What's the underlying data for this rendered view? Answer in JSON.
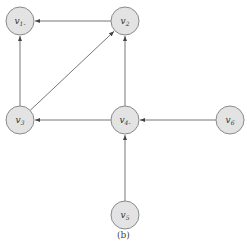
{
  "diagram": {
    "caption": "(b)",
    "nodes": [
      {
        "id": "v1",
        "base": "v",
        "sub": "1",
        "suffix": "-"
      },
      {
        "id": "v2",
        "base": "v",
        "sub": "2",
        "suffix": ""
      },
      {
        "id": "v3",
        "base": "v",
        "sub": "3",
        "suffix": ""
      },
      {
        "id": "v4",
        "base": "v",
        "sub": "4",
        "suffix": "-"
      },
      {
        "id": "v6",
        "base": "v",
        "sub": "6",
        "suffix": ""
      },
      {
        "id": "v5",
        "base": "v",
        "sub": "5",
        "suffix": ""
      }
    ],
    "edges": [
      {
        "from": "v2",
        "to": "v1"
      },
      {
        "from": "v3",
        "to": "v1"
      },
      {
        "from": "v3",
        "to": "v2"
      },
      {
        "from": "v4",
        "to": "v2"
      },
      {
        "from": "v4",
        "to": "v3"
      },
      {
        "from": "v6",
        "to": "v4"
      },
      {
        "from": "v5",
        "to": "v4"
      }
    ],
    "colors": {
      "node_fill": "#e3e3e3",
      "node_stroke": "#8a8a8a",
      "edge": "#666666"
    }
  }
}
